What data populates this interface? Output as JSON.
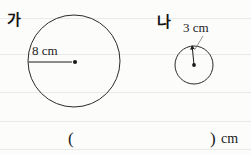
{
  "page": {
    "kind": "math-worksheet-figure",
    "background_color": "#fcfcfb",
    "ink_color": "#1b1b1b",
    "width": 251,
    "height": 154
  },
  "figures": {
    "big": {
      "name_label": "가",
      "radius_label": "8 cm",
      "radius_value": 8,
      "unit": "cm",
      "center_x": 74,
      "center_y": 61,
      "pixel_radius": 46,
      "radius_marker": "arrow-right-with-dot"
    },
    "small": {
      "name_label": "나",
      "radius_label": "3 cm",
      "radius_value": 3,
      "unit": "cm",
      "center_x": 194,
      "center_y": 65,
      "pixel_radius": 19,
      "radius_marker": "arrow-up-with-leader"
    }
  },
  "answer_row": {
    "paren_open": "(",
    "paren_close": ")",
    "unit": "cm",
    "value": ""
  }
}
